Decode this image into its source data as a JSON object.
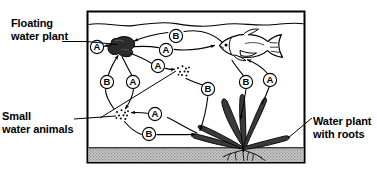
{
  "diagram": {
    "type": "illustration",
    "frame": {
      "border_color": "#000000",
      "background_color": "#ffffff",
      "substrate_color": "#b4b4b4"
    },
    "labels": [
      {
        "name": "floating-water-plant",
        "line1": "Floating",
        "line2": "water plant"
      },
      {
        "name": "small-water-animals",
        "line1": "Small",
        "line2": "water animals"
      },
      {
        "name": "water-plant-with-roots",
        "line1": "Water plant",
        "line2": "with roots"
      }
    ],
    "process_markers": [
      {
        "id": "m1",
        "letter": "A",
        "x": 97,
        "y": 47
      },
      {
        "id": "m2",
        "letter": "B",
        "x": 176,
        "y": 36
      },
      {
        "id": "m3",
        "letter": "A",
        "x": 166,
        "y": 50
      },
      {
        "id": "m4",
        "letter": "A",
        "x": 158,
        "y": 66
      },
      {
        "id": "m5",
        "letter": "B",
        "x": 107,
        "y": 82
      },
      {
        "id": "m6",
        "letter": "A",
        "x": 133,
        "y": 82
      },
      {
        "id": "m7",
        "letter": "B",
        "x": 208,
        "y": 89
      },
      {
        "id": "m8",
        "letter": "B",
        "x": 246,
        "y": 82
      },
      {
        "id": "m9",
        "letter": "A",
        "x": 270,
        "y": 80
      },
      {
        "id": "m10",
        "letter": "A",
        "x": 155,
        "y": 114
      },
      {
        "id": "m11",
        "letter": "B",
        "x": 149,
        "y": 134
      }
    ],
    "organisms": [
      {
        "name": "floating-water-plant",
        "kind": "plant",
        "fill": "#2b2b2b"
      },
      {
        "name": "fish",
        "kind": "animal",
        "fill": "#ffffff"
      },
      {
        "name": "rooted-water-plant",
        "kind": "plant",
        "fill": "#3a3a3a"
      },
      {
        "name": "small-water-animals-upper",
        "kind": "animal",
        "fill": "#000000"
      },
      {
        "name": "small-water-animals-lower",
        "kind": "animal",
        "fill": "#000000"
      }
    ]
  }
}
